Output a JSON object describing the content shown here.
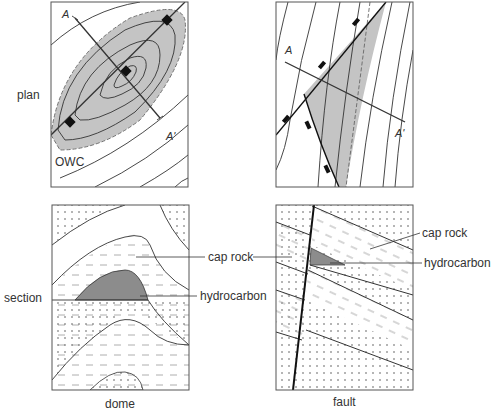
{
  "rows": {
    "plan": "plan",
    "section": "section"
  },
  "columns": {
    "dome": "dome",
    "fault": "fault"
  },
  "plan_dome": {
    "marker_a": "A",
    "marker_a_prime": "A'",
    "owc": "OWC"
  },
  "plan_fault": {
    "marker_a": "A",
    "marker_a_prime": "A'"
  },
  "section_labels": {
    "cap_rock": "cap rock",
    "hydrocarbon": "hydrocarbon"
  },
  "colors": {
    "hydrocarbon_plan": "#c4c4c4",
    "hydrocarbon_section": "#8c8c8c",
    "line": "#222222"
  }
}
